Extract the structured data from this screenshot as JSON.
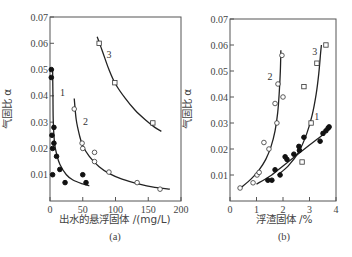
{
  "chart_data": [
    {
      "type": "scatter",
      "panel_label": "(a)",
      "title": "",
      "xlabel": "出水的悬浮固体 /(mg/L)",
      "ylabel": "气固比 α",
      "xlim": [
        0,
        200
      ],
      "ylim": [
        0,
        0.07
      ],
      "xticks": [
        0,
        50,
        100,
        150,
        200
      ],
      "xtick_labels": [
        "0",
        "50",
        "100",
        "150",
        "200"
      ],
      "yticks": [
        0.01,
        0.02,
        0.03,
        0.04,
        0.05,
        0.06,
        0.07
      ],
      "ytick_labels": [
        "0.01",
        "0.02",
        "0.03",
        "0.04",
        "0.05",
        "0.06",
        "0.07"
      ],
      "grid": false,
      "series": [
        {
          "name": "1",
          "marker": "filled-circle",
          "points": [
            [
              2,
              0.05
            ],
            [
              2,
              0.047
            ],
            [
              6,
              0.028
            ],
            [
              3,
              0.025
            ],
            [
              6,
              0.022
            ],
            [
              4,
              0.02
            ],
            [
              10,
              0.017
            ],
            [
              15,
              0.012
            ],
            [
              4,
              0.01
            ],
            [
              23,
              0.007
            ],
            [
              50,
              0.01
            ],
            [
              55,
              0.007
            ]
          ],
          "curve": [
            [
              4,
              0.05
            ],
            [
              4.5,
              0.04
            ],
            [
              5,
              0.03
            ],
            [
              7,
              0.022
            ],
            [
              10,
              0.018
            ],
            [
              15,
              0.014
            ],
            [
              25,
              0.01
            ],
            [
              35,
              0.008
            ],
            [
              50,
              0.0065
            ],
            [
              60,
              0.0058
            ]
          ]
        },
        {
          "name": "2",
          "marker": "open-circle",
          "points": [
            [
              37,
              0.035
            ],
            [
              49,
              0.022
            ],
            [
              50,
              0.02
            ],
            [
              68,
              0.0185
            ],
            [
              68,
              0.015
            ],
            [
              90,
              0.011
            ],
            [
              133,
              0.007
            ],
            [
              168,
              0.0045
            ]
          ],
          "curve": [
            [
              37,
              0.039
            ],
            [
              40,
              0.031
            ],
            [
              45,
              0.025
            ],
            [
              50,
              0.021
            ],
            [
              60,
              0.017
            ],
            [
              75,
              0.013
            ],
            [
              90,
              0.0105
            ],
            [
              110,
              0.0083
            ],
            [
              135,
              0.0065
            ],
            [
              160,
              0.0052
            ],
            [
              183,
              0.0045
            ]
          ]
        },
        {
          "name": "3",
          "marker": "open-square",
          "points": [
            [
              75,
              0.06
            ],
            [
              99,
              0.045
            ],
            [
              157,
              0.0297
            ]
          ],
          "curve": [
            [
              72,
              0.0625
            ],
            [
              80,
              0.057
            ],
            [
              90,
              0.05
            ],
            [
              100,
              0.0445
            ],
            [
              115,
              0.039
            ],
            [
              130,
              0.0345
            ],
            [
              145,
              0.031
            ],
            [
              160,
              0.028
            ],
            [
              170,
              0.0265
            ]
          ]
        }
      ]
    },
    {
      "type": "scatter",
      "panel_label": "(b)",
      "title": "",
      "xlabel": "浮渣固体 /%",
      "ylabel": "气固比 α",
      "xlim": [
        0,
        4
      ],
      "ylim": [
        0,
        0.07
      ],
      "xticks": [
        0,
        1,
        2,
        3,
        4
      ],
      "xtick_labels": [
        "0",
        "1",
        "2",
        "3",
        "4"
      ],
      "yticks": [
        0.01,
        0.02,
        0.03,
        0.04,
        0.05,
        0.06,
        0.07
      ],
      "ytick_labels": [
        "0.01",
        "0.02",
        "0.03",
        "0.04",
        "0.05",
        "0.06",
        "0.07"
      ],
      "grid": false,
      "series": [
        {
          "name": "1",
          "marker": "filled-circle",
          "points": [
            [
              1.43,
              0.008
            ],
            [
              1.58,
              0.008
            ],
            [
              1.7,
              0.012
            ],
            [
              1.89,
              0.01
            ],
            [
              2.08,
              0.017
            ],
            [
              2.15,
              0.016
            ],
            [
              2.41,
              0.018
            ],
            [
              2.6,
              0.021
            ],
            [
              2.62,
              0.0195
            ],
            [
              2.79,
              0.0245
            ],
            [
              3.4,
              0.023
            ],
            [
              3.51,
              0.026
            ],
            [
              3.62,
              0.027
            ],
            [
              3.7,
              0.028
            ],
            [
              3.74,
              0.0285
            ]
          ],
          "curve": [
            [
              1.0,
              0.0065
            ],
            [
              1.5,
              0.0095
            ],
            [
              2.0,
              0.0135
            ],
            [
              2.5,
              0.0175
            ],
            [
              3.0,
              0.0215
            ],
            [
              3.5,
              0.0255
            ],
            [
              3.78,
              0.0285
            ]
          ]
        },
        {
          "name": "2",
          "marker": "open-circle",
          "points": [
            [
              0.38,
              0.005
            ],
            [
              0.87,
              0.007
            ],
            [
              1.02,
              0.01
            ],
            [
              1.1,
              0.011
            ],
            [
              1.28,
              0.0225
            ],
            [
              1.47,
              0.02
            ],
            [
              1.77,
              0.03
            ],
            [
              1.7,
              0.0375
            ],
            [
              2.0,
              0.04
            ],
            [
              1.81,
              0.045
            ],
            [
              1.96,
              0.056
            ]
          ],
          "curve": [
            [
              0.4,
              0.005
            ],
            [
              0.8,
              0.0085
            ],
            [
              1.1,
              0.012
            ],
            [
              1.35,
              0.016
            ],
            [
              1.55,
              0.021
            ],
            [
              1.7,
              0.027
            ],
            [
              1.8,
              0.034
            ],
            [
              1.86,
              0.042
            ],
            [
              1.9,
              0.05
            ],
            [
              1.92,
              0.058
            ]
          ]
        },
        {
          "name": "3",
          "marker": "open-square",
          "points": [
            [
              2.72,
              0.015
            ],
            [
              3.06,
              0.03
            ],
            [
              2.79,
              0.044
            ],
            [
              3.28,
              0.053
            ],
            [
              3.62,
              0.06
            ]
          ],
          "curve": [
            [
              1.8,
              0.01
            ],
            [
              2.2,
              0.0135
            ],
            [
              2.6,
              0.019
            ],
            [
              2.9,
              0.026
            ],
            [
              3.1,
              0.033
            ],
            [
              3.25,
              0.041
            ],
            [
              3.35,
              0.049
            ],
            [
              3.42,
              0.057
            ],
            [
              3.45,
              0.06
            ]
          ]
        }
      ]
    }
  ]
}
